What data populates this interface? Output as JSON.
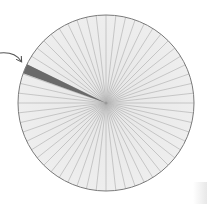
{
  "diagram": {
    "type": "segmented-circle",
    "center": [
      106,
      103
    ],
    "radius": 88,
    "segments": 56,
    "highlighted_segment_angle_deg": 157,
    "colors": {
      "fill": "#ececec",
      "spoke": "#b4b4b4",
      "outline": "#7a7a7a",
      "highlight": "#6a6a6a",
      "arrow": "#555555"
    },
    "arrow": {
      "points_to": "highlighted-segment"
    }
  }
}
